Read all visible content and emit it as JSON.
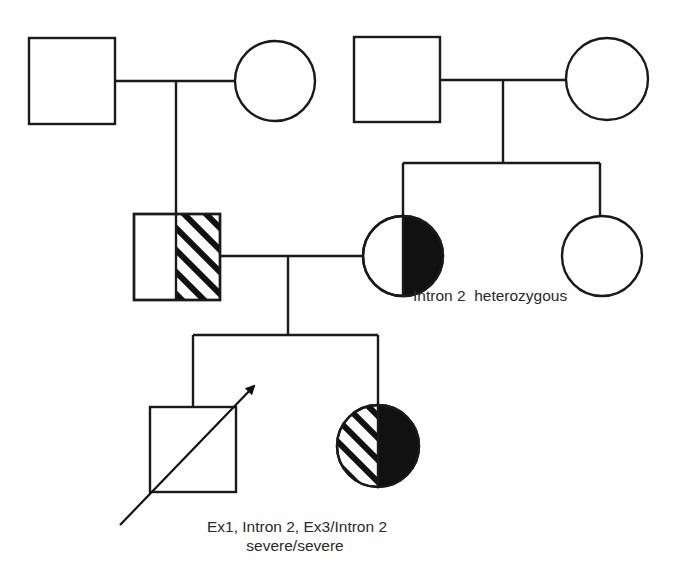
{
  "diagram": {
    "type": "pedigree",
    "colors": {
      "line": "#1a1a1a",
      "fill_affected": "#111111",
      "background": "#ffffff",
      "text": "#2a2a2a"
    },
    "legend_patterns": {
      "hatched_half": "carrier of one allele (hatched)",
      "solid_half": "carrier of Intron 2 allele (solid)"
    },
    "generations": [
      {
        "id": "I",
        "individuals": [
          {
            "id": "I-1",
            "sex": "male",
            "fill": "none"
          },
          {
            "id": "I-2",
            "sex": "female",
            "fill": "none"
          },
          {
            "id": "I-3",
            "sex": "male",
            "fill": "none"
          },
          {
            "id": "I-4",
            "sex": "female",
            "fill": "none"
          }
        ]
      },
      {
        "id": "II",
        "individuals": [
          {
            "id": "II-1",
            "sex": "male",
            "fill": "right-half-hatched"
          },
          {
            "id": "II-2",
            "sex": "female",
            "fill": "right-half-solid",
            "label": "Intron 2  heterozygous"
          },
          {
            "id": "II-3",
            "sex": "female",
            "fill": "none"
          }
        ]
      },
      {
        "id": "III",
        "individuals": [
          {
            "id": "III-1",
            "sex": "male",
            "fill": "none",
            "proband": true,
            "label_line1": "Ex1, Intron 2, Ex3/Intron 2",
            "label_line2": "severe/severe"
          },
          {
            "id": "III-2",
            "sex": "female",
            "fill": "left-hatched-right-solid"
          }
        ]
      }
    ],
    "labels": {
      "mother_genotype": "Intron 2  heterozygous",
      "proband_genotype": "Ex1, Intron 2, Ex3/Intron 2",
      "proband_phenotype": "severe/severe"
    }
  }
}
